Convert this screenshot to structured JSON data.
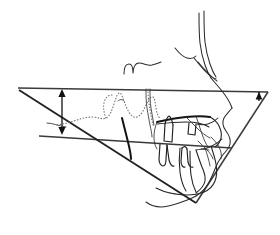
{
  "figure": {
    "type": "line-drawing",
    "background_color": "#ffffff",
    "width": 280,
    "height": 235
  },
  "palette": {
    "soft_tissue": "#2b2b2b",
    "bone_outline": "#262626",
    "reference_plane": "#3a3a3a",
    "heavy_plane": "#222222",
    "tooth": "#1f1f1f",
    "dotted_structure": "#6d6d6d",
    "measurement_arrow": "#111111"
  },
  "reference_planes": [
    {
      "name": "frankfort-horizontal-plane",
      "label": "Frankfort horizontal",
      "style": "solid",
      "start": [
        18,
        88
      ],
      "end": [
        268,
        92
      ]
    },
    {
      "name": "palatal-plane",
      "label": "Palatal plane",
      "style": "solid",
      "start": [
        39,
        136
      ],
      "end": [
        232,
        148
      ]
    },
    {
      "name": "mandibular-plane",
      "label": "Mandibular plane",
      "style": "solid",
      "start": [
        19,
        90
      ],
      "end": [
        196,
        203
      ]
    },
    {
      "name": "posterior-facial-plane",
      "label": "Posterior facial plane",
      "style": "solid",
      "start": [
        268,
        92
      ],
      "end": [
        196,
        203
      ]
    }
  ],
  "measurements": [
    {
      "name": "anterior-vertical-measure",
      "label": "Anterior vertical height",
      "style": "double-headed-arrow",
      "orientation": "vertical",
      "from": [
        62,
        90
      ],
      "to": [
        62,
        134
      ]
    },
    {
      "name": "posterior-angle-indicator",
      "label": "Posterior angle indicator",
      "style": "single-arrowhead",
      "orientation": "down",
      "at": [
        259,
        93
      ]
    },
    {
      "name": "palatal-left-tick",
      "label": "Palatal plane reference tick",
      "style": "short-line",
      "from": [
        48,
        124
      ],
      "to": [
        66,
        128
      ]
    }
  ],
  "structures": [
    {
      "name": "forehead-soft-tissue",
      "label": "Forehead and nasal bridge soft tissue"
    },
    {
      "name": "nose-profile",
      "label": "Nasal profile"
    },
    {
      "name": "upper-lip-profile",
      "label": "Upper lip soft tissue"
    },
    {
      "name": "lower-lip-profile",
      "label": "Lower lip soft tissue"
    },
    {
      "name": "chin-profile",
      "label": "Chin soft tissue"
    },
    {
      "name": "sella-turcica",
      "label": "Sella turcica squiggle"
    },
    {
      "name": "cranial-base-outline",
      "label": "Cranial base stippled outline"
    },
    {
      "name": "orbital-floor",
      "label": "Orbital floor"
    },
    {
      "name": "pterygomaxillary-fissure",
      "label": "Pterygomaxillary fissure"
    },
    {
      "name": "hard-palate",
      "label": "Hard palate / maxilla"
    },
    {
      "name": "upper-incisor",
      "label": "Upper central incisor"
    },
    {
      "name": "lower-incisor",
      "label": "Lower central incisor"
    },
    {
      "name": "upper-molar",
      "label": "Upper molar"
    },
    {
      "name": "lower-molar",
      "label": "Lower molar"
    },
    {
      "name": "mandible-body",
      "label": "Mandibular body"
    },
    {
      "name": "mandibular-symphysis",
      "label": "Mandibular symphysis"
    },
    {
      "name": "condyle-ramus",
      "label": "Condyle and ramus"
    }
  ]
}
